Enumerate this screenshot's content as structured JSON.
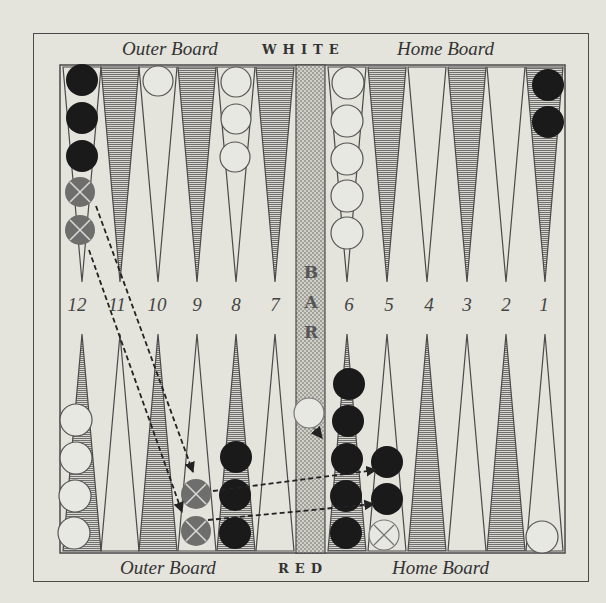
{
  "header": {
    "left_label": "Outer Board",
    "center_label": "WHITE",
    "right_label": "Home Board"
  },
  "footer": {
    "left_label": "Outer Board",
    "center_label": "RED",
    "right_label": "Home Board"
  },
  "bar": {
    "letters": [
      "B",
      "A",
      "R"
    ]
  },
  "point_numbers": [
    "12",
    "11",
    "10",
    "9",
    "8",
    "7",
    "6",
    "5",
    "4",
    "3",
    "2",
    "1"
  ],
  "colors": {
    "background": "#e4e3dc",
    "line": "#4a4a4a",
    "shaded_point": "#8a8a88",
    "black_checker": "#1a1a1a",
    "white_checker": "#e8e8e2",
    "crossed_checker": "#6e6e6c",
    "bar_fill": "#bdbcb6"
  },
  "checkers": {
    "top": [
      {
        "point": "12",
        "color": "black",
        "count": 3,
        "crossed_dark": 2
      },
      {
        "point": "10",
        "color": "white",
        "count": 1
      },
      {
        "point": "8",
        "color": "white",
        "count": 3
      },
      {
        "point": "6",
        "color": "white",
        "count": 5
      },
      {
        "point": "1",
        "color": "black",
        "count": 2
      }
    ],
    "bottom": [
      {
        "point": "12",
        "color": "white",
        "count": 4
      },
      {
        "point": "9",
        "color": "crossed_dark",
        "count": 2
      },
      {
        "point": "8",
        "color": "black",
        "count": 3
      },
      {
        "point": "6",
        "color": "black",
        "count": 5
      },
      {
        "point": "5",
        "color": "black",
        "count": 2,
        "crossed_white": 1
      },
      {
        "point": "1",
        "color": "white",
        "count": 1
      }
    ],
    "bar": [
      {
        "color": "white",
        "count": 1
      }
    ]
  },
  "moves": [
    {
      "from": "top-12 (crossed)",
      "to": "bottom-9",
      "style": "dashed-arrow"
    },
    {
      "from": "top-12 (crossed)",
      "to": "bottom-9",
      "style": "dashed-arrow"
    },
    {
      "from": "bottom-9",
      "to": "bottom-5",
      "style": "dashed-arrow"
    },
    {
      "from": "bottom-9",
      "to": "bottom-5",
      "style": "dashed-arrow"
    },
    {
      "from": "bar",
      "to": "bottom-6",
      "style": "short-arrow"
    }
  ]
}
